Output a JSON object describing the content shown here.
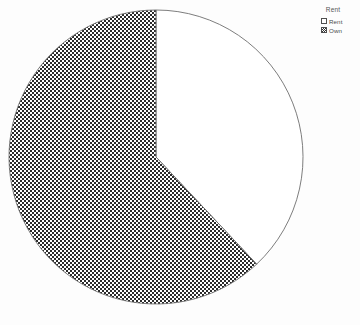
{
  "chart_data": {
    "type": "pie",
    "title": "",
    "legend_title": "Rent",
    "legend_position": "top-right",
    "grid": false,
    "categories": [
      "Rent",
      "Own"
    ],
    "values": [
      38,
      62
    ],
    "slices": [
      {
        "label": "Rent",
        "value": 38,
        "percent": 38,
        "start_angle_deg": 0,
        "end_angle_deg": 136.8,
        "fill": "#ffffff",
        "fill_style": "solid",
        "stroke": "#6e6e6e"
      },
      {
        "label": "Own",
        "value": 62,
        "percent": 62,
        "start_angle_deg": 136.8,
        "end_angle_deg": 360,
        "fill": "#ffffff",
        "fill_style": "checkerboard",
        "pattern_color": "#2b2b2b",
        "stroke": "#6e6e6e"
      }
    ],
    "xlabel": "",
    "ylabel": ""
  },
  "canvas": {
    "background": "#fdfdfd",
    "width": 360,
    "height": 325,
    "center_x": 156,
    "center_y": 157,
    "radius": 147
  },
  "legend": {
    "title": "Rent",
    "items": [
      {
        "label": "Rent",
        "swatch": "solid-white-swatch"
      },
      {
        "label": "Own",
        "swatch": "checkerboard-swatch"
      }
    ]
  }
}
